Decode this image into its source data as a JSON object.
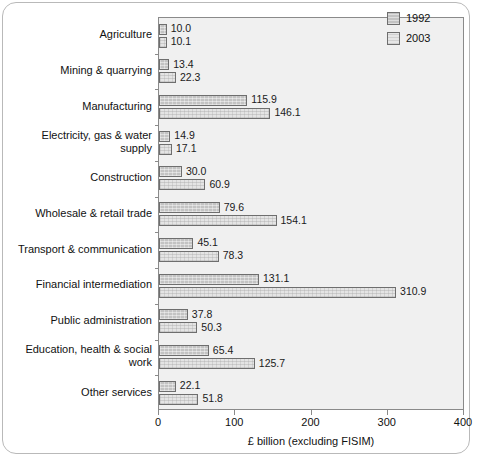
{
  "chart_data": {
    "type": "bar",
    "orientation": "horizontal",
    "title": "",
    "xlabel": "£ billion (excluding FISIM)",
    "ylabel": "",
    "xlim": [
      0,
      400
    ],
    "xticks": [
      0,
      100,
      200,
      300,
      400
    ],
    "xtick_labels": [
      "0",
      "100",
      "200",
      "300",
      "400"
    ],
    "grid": false,
    "legend_position": "top-right",
    "categories": [
      "Agriculture",
      "Mining & quarrying",
      "Manufacturing",
      "Electricity, gas & water supply",
      "Construction",
      "Wholesale & retail trade",
      "Transport & communication",
      "Financial intermediation",
      "Public administration",
      "Education, health & social work",
      "Other services"
    ],
    "series": [
      {
        "name": "1992",
        "color": "#c3c3c3",
        "values": [
          10.0,
          13.4,
          115.9,
          14.9,
          30.0,
          79.6,
          45.1,
          131.1,
          37.8,
          65.4,
          22.1
        ],
        "labels": [
          "10.0",
          "13.4",
          "115.9",
          "14.9",
          "30.0",
          "79.6",
          "45.1",
          "131.1",
          "37.8",
          "65.4",
          "22.1"
        ]
      },
      {
        "name": "2003",
        "color": "#e4e4e4",
        "values": [
          10.1,
          22.3,
          146.1,
          17.1,
          60.9,
          154.1,
          78.3,
          310.9,
          50.3,
          125.7,
          51.8
        ],
        "labels": [
          "10.1",
          "22.3",
          "146.1",
          "17.1",
          "60.9",
          "154.1",
          "78.3",
          "310.9",
          "50.3",
          "125.7",
          "51.8"
        ]
      }
    ]
  },
  "legend": {
    "items": [
      {
        "label": "1992",
        "swatch": "swatch-1992"
      },
      {
        "label": "2003",
        "swatch": "swatch-2003"
      }
    ]
  }
}
